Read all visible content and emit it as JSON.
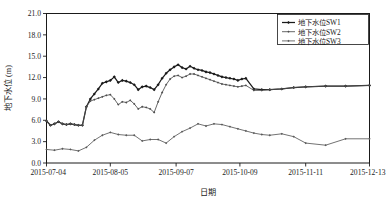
{
  "chart_data": {
    "type": "line",
    "title": "",
    "xlabel": "日期",
    "ylabel": "地下水位 (m)",
    "ylim": [
      0.0,
      21.0
    ],
    "yticks": [
      "0.0",
      "3.0",
      "6.0",
      "9.0",
      "12.0",
      "15.0",
      "18.0",
      "21.0"
    ],
    "ytick_values": [
      0.0,
      3.0,
      6.0,
      9.0,
      12.0,
      15.0,
      18.0,
      21.0
    ],
    "xticks": [
      "2015-07-04",
      "2015-08-05",
      "2015-09-07",
      "2015-10-09",
      "2015-11-11",
      "2015-12-13"
    ],
    "xtick_positions": [
      0,
      32,
      65,
      97,
      130,
      162
    ],
    "xlim": [
      0,
      162
    ],
    "grid": false,
    "legend_position": "top-right",
    "series": [
      {
        "name": "地下水位SW1",
        "color": "#1a1a1a",
        "marker": "diamond",
        "x": [
          0,
          2,
          4,
          6,
          8,
          10,
          12,
          14,
          16,
          18,
          20,
          22,
          24,
          26,
          28,
          30,
          32,
          34,
          36,
          38,
          40,
          42,
          44,
          46,
          48,
          50,
          52,
          54,
          56,
          58,
          60,
          62,
          64,
          66,
          68,
          70,
          72,
          74,
          76,
          78,
          80,
          82,
          84,
          86,
          88,
          90,
          92,
          94,
          96,
          98,
          100,
          104,
          108,
          112,
          118,
          124,
          130,
          140,
          150,
          162
        ],
        "values": [
          5.9,
          5.3,
          5.5,
          5.8,
          5.5,
          5.4,
          5.5,
          5.4,
          5.3,
          5.3,
          7.9,
          9.0,
          9.7,
          10.4,
          11.2,
          11.4,
          11.6,
          12.1,
          11.3,
          11.6,
          11.5,
          11.3,
          11.0,
          10.3,
          10.7,
          10.8,
          10.6,
          10.3,
          11.0,
          11.9,
          12.6,
          13.1,
          13.5,
          13.8,
          13.4,
          13.2,
          13.6,
          13.3,
          13.1,
          13.0,
          12.8,
          12.7,
          12.5,
          12.3,
          12.1,
          12.0,
          11.9,
          11.8,
          11.6,
          11.8,
          11.9,
          10.4,
          10.3,
          10.3,
          10.4,
          10.6,
          10.7,
          10.8,
          10.8,
          10.9
        ]
      },
      {
        "name": "地下水位SW2",
        "color": "#4d4d4d",
        "marker": "diamond",
        "x": [
          0,
          2,
          4,
          6,
          8,
          10,
          12,
          14,
          16,
          18,
          20,
          22,
          24,
          26,
          28,
          30,
          32,
          34,
          36,
          38,
          40,
          42,
          44,
          46,
          48,
          50,
          52,
          54,
          56,
          58,
          60,
          62,
          64,
          66,
          68,
          70,
          72,
          74,
          76,
          78,
          80,
          82,
          84,
          86,
          88,
          90,
          92,
          94,
          96,
          98,
          100,
          104,
          108,
          112,
          118,
          124,
          130,
          140,
          150,
          162
        ],
        "values": [
          5.9,
          5.3,
          5.5,
          5.8,
          5.5,
          5.4,
          5.5,
          5.4,
          5.3,
          5.3,
          7.9,
          8.7,
          8.9,
          9.1,
          9.3,
          9.5,
          9.6,
          9.0,
          8.2,
          8.6,
          8.5,
          8.8,
          8.3,
          7.6,
          7.9,
          7.8,
          7.6,
          7.1,
          8.6,
          9.9,
          11.0,
          11.8,
          12.2,
          12.3,
          12.0,
          12.2,
          12.5,
          12.5,
          12.3,
          12.1,
          11.9,
          11.7,
          11.5,
          11.3,
          11.1,
          11.0,
          10.9,
          10.8,
          10.7,
          10.8,
          10.9,
          10.2,
          10.2,
          10.3,
          10.4,
          10.6,
          10.7,
          10.8,
          10.8,
          10.9
        ]
      },
      {
        "name": "地下水位SW3",
        "color": "#595959",
        "marker": "diamond",
        "x": [
          0,
          4,
          8,
          12,
          16,
          20,
          24,
          28,
          32,
          36,
          40,
          44,
          48,
          52,
          56,
          60,
          64,
          68,
          72,
          76,
          80,
          84,
          88,
          92,
          96,
          100,
          104,
          108,
          112,
          118,
          124,
          130,
          140,
          150,
          162
        ],
        "values": [
          1.9,
          1.8,
          2.0,
          1.9,
          1.7,
          2.2,
          3.2,
          3.9,
          4.3,
          4.0,
          3.9,
          3.9,
          3.1,
          3.3,
          3.3,
          2.8,
          3.7,
          4.4,
          4.9,
          5.5,
          5.2,
          5.5,
          5.4,
          5.1,
          4.8,
          4.5,
          4.2,
          4.0,
          3.9,
          4.1,
          3.7,
          2.8,
          2.5,
          3.4,
          3.4
        ]
      }
    ]
  },
  "legend": {
    "items": [
      {
        "label": "地下水位SW1"
      },
      {
        "label": "地下水位SW2"
      },
      {
        "label": "地下水位SW3"
      }
    ]
  },
  "axes": {
    "y_title": "地下水位 (m)",
    "x_title": "日期"
  }
}
